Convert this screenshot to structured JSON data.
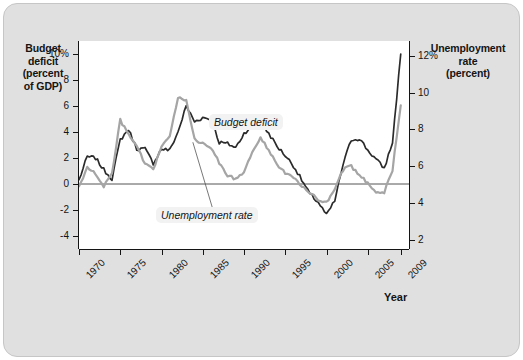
{
  "chart_data": {
    "type": "line",
    "title": "",
    "xlabel": "Year",
    "grid": false,
    "legend_position": "inline-annotations",
    "axes": {
      "x": {
        "label": "Year",
        "ticks": [
          "1970",
          "1975",
          "1980",
          "1985",
          "1990",
          "1995",
          "2000",
          "2005",
          "2009"
        ],
        "tick_values": [
          1970,
          1975,
          1980,
          1985,
          1990,
          1995,
          2000,
          2005,
          2009
        ],
        "range": [
          1970,
          2010
        ]
      },
      "y_left": {
        "label": "Budget deficit (percent of GDP)",
        "ticks": [
          "10%",
          "8",
          "6",
          "4",
          "2",
          "0",
          "-2",
          "-4"
        ],
        "tick_values": [
          10,
          8,
          6,
          4,
          2,
          0,
          -2,
          -4
        ],
        "range": [
          -5,
          11
        ]
      },
      "y_right": {
        "label": "Unemployment rate (percent)",
        "ticks": [
          "12%",
          "10",
          "8",
          "6",
          "4",
          "2"
        ],
        "tick_values": [
          12,
          10,
          8,
          6,
          4,
          2
        ],
        "range": [
          1.5,
          12.8
        ]
      }
    },
    "captions": {
      "left_axis_title": "Budget\ndeficit\n(percent\nof GDP)",
      "left_axis_title_lines": [
        "Budget",
        "deficit",
        "(percent",
        "of GDP)"
      ],
      "right_axis_title_lines": [
        "Unemployment",
        "rate",
        "(percent)"
      ]
    },
    "series": [
      {
        "name": "Budget deficit",
        "axis": "left",
        "color": "#2b2b2b",
        "unit": "percent of GDP",
        "x": [
          1970,
          1971,
          1972,
          1973,
          1974,
          1975,
          1976,
          1977,
          1978,
          1979,
          1980,
          1981,
          1982,
          1983,
          1984,
          1985,
          1986,
          1987,
          1988,
          1989,
          1990,
          1991,
          1992,
          1993,
          1994,
          1995,
          1996,
          1997,
          1998,
          1999,
          2000,
          2001,
          2002,
          2003,
          2004,
          2005,
          2006,
          2007,
          2008,
          2009
        ],
        "values": [
          0.3,
          2.1,
          2.0,
          1.1,
          0.4,
          3.4,
          4.2,
          2.7,
          2.7,
          1.6,
          2.7,
          2.6,
          4.0,
          6.0,
          4.8,
          5.1,
          5.0,
          3.2,
          3.1,
          2.8,
          3.9,
          4.5,
          4.7,
          3.9,
          2.9,
          2.2,
          1.4,
          0.3,
          -0.8,
          -1.4,
          -2.4,
          -1.3,
          1.5,
          3.4,
          3.5,
          2.6,
          1.9,
          1.2,
          3.2,
          10.0
        ]
      },
      {
        "name": "Unemployment rate",
        "axis": "right",
        "color": "#a5a5a5",
        "unit": "percent",
        "x": [
          1970,
          1971,
          1972,
          1973,
          1974,
          1975,
          1976,
          1977,
          1978,
          1979,
          1980,
          1981,
          1982,
          1983,
          1984,
          1985,
          1986,
          1987,
          1988,
          1989,
          1990,
          1991,
          1992,
          1993,
          1994,
          1995,
          1996,
          1997,
          1998,
          1999,
          2000,
          2001,
          2002,
          2003,
          2004,
          2005,
          2006,
          2007,
          2008,
          2009
        ],
        "values": [
          4.9,
          5.9,
          5.6,
          4.9,
          5.6,
          8.5,
          7.7,
          7.1,
          6.1,
          5.8,
          7.1,
          7.6,
          9.7,
          9.6,
          7.5,
          7.2,
          7.0,
          6.2,
          5.5,
          5.3,
          5.6,
          6.8,
          7.5,
          6.9,
          6.1,
          5.6,
          5.4,
          4.9,
          4.5,
          4.2,
          4.0,
          4.7,
          5.8,
          6.0,
          5.5,
          5.1,
          4.6,
          4.6,
          5.8,
          9.3
        ]
      }
    ],
    "annotations": [
      {
        "text": "Budget deficit",
        "series": "Budget deficit",
        "style": "italic"
      },
      {
        "text": "Unemployment rate",
        "series": "Unemployment rate",
        "style": "italic"
      }
    ],
    "colors": {
      "budget_deficit_line": "#2b2b2b",
      "unemployment_line": "#a5a5a5",
      "plot_background": "#ffffff",
      "card_background": "#e0e0e0",
      "zero_line": "#555555"
    }
  }
}
